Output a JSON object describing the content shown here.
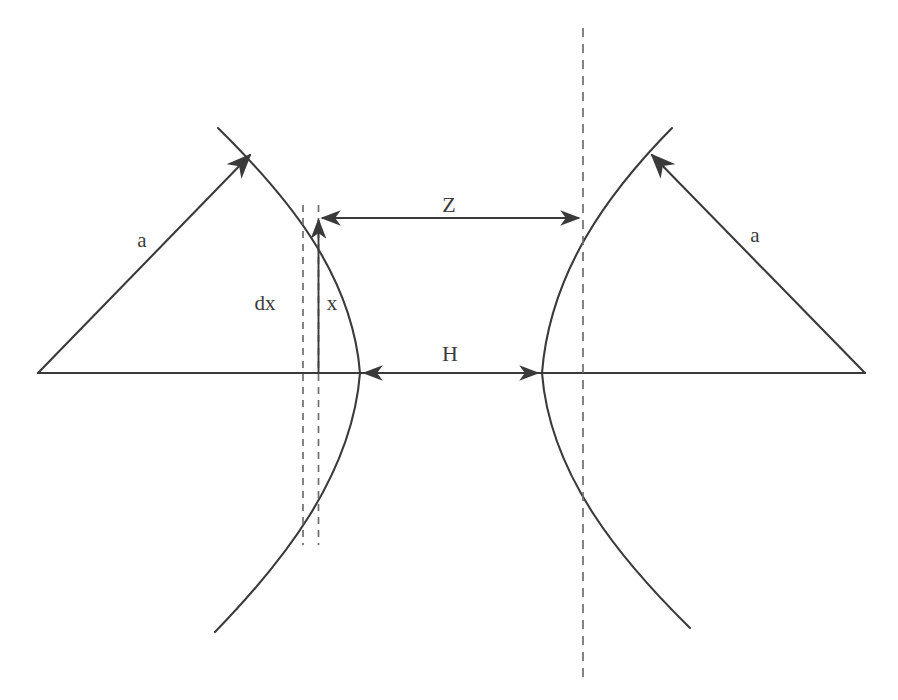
{
  "figure": {
    "background_color": "#ffffff",
    "stroke_color": "#3a3a3a",
    "dashed_color": "#6e6e6e",
    "canvas": {
      "width": 898,
      "height": 700
    }
  },
  "labels": [
    {
      "id": "a-left",
      "text": "a",
      "x": 142,
      "y": 240,
      "role": "radius-left"
    },
    {
      "id": "a-right",
      "text": "a",
      "x": 755,
      "y": 235,
      "role": "radius-right"
    },
    {
      "id": "dx",
      "text": "dx",
      "x": 265,
      "y": 303,
      "role": "element-width"
    },
    {
      "id": "x",
      "text": "x",
      "x": 332,
      "y": 303,
      "role": "element-height"
    },
    {
      "id": "Z",
      "text": "Z",
      "x": 449,
      "y": 205,
      "role": "upper-gap"
    },
    {
      "id": "H",
      "text": "H",
      "x": 450,
      "y": 354,
      "role": "axis-gap"
    }
  ],
  "geometry": {
    "axis": {
      "name": "horizontal-axis",
      "y": 373,
      "x1": 38,
      "x2": 865
    },
    "left_triangle": {
      "apex": [
        250,
        155
      ],
      "base_left": [
        38,
        373
      ],
      "base_right": [
        360,
        373
      ],
      "arrow_on_hypotenuse": true
    },
    "right_triangle": {
      "apex": [
        652,
        155
      ],
      "base_left": [
        542,
        373
      ],
      "base_right": [
        865,
        373
      ],
      "arrow_on_hypotenuse": true
    },
    "left_arc": {
      "vertex": [
        360,
        373
      ],
      "top_tip": [
        218,
        128
      ],
      "bottom_tip": [
        215,
        632
      ],
      "opens": "left"
    },
    "right_arc": {
      "vertex": [
        542,
        373
      ],
      "top_tip": [
        672,
        128
      ],
      "bottom_tip": [
        690,
        628
      ],
      "opens": "right"
    },
    "dashed_lines": [
      {
        "id": "dashed-dx-left",
        "x": 303,
        "y1": 205,
        "y2": 545
      },
      {
        "id": "dashed-dx-right",
        "x": 318,
        "y1": 205,
        "y2": 545
      },
      {
        "id": "dashed-center-right",
        "x": 583,
        "y1": 28,
        "y2": 680
      }
    ],
    "dimension_arrows": [
      {
        "id": "Z-arrow",
        "y": 218,
        "x1": 318,
        "x2": 583,
        "heads": "both"
      },
      {
        "id": "H-arrow",
        "y": 373,
        "x1": 360,
        "x2": 542,
        "heads": "both"
      },
      {
        "id": "x-arrow",
        "x": 318,
        "y1": 373,
        "y2": 218,
        "heads": "up"
      }
    ]
  }
}
